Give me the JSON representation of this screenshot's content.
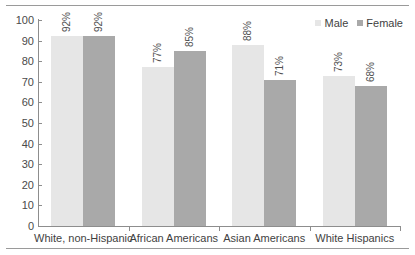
{
  "chart_data": {
    "type": "bar",
    "title": "",
    "subtitle": "",
    "xlabel": "",
    "ylabel": "",
    "ylim": [
      0,
      100
    ],
    "yticks": [
      0,
      10,
      20,
      30,
      40,
      50,
      60,
      70,
      80,
      90,
      100
    ],
    "ytick_labels": [
      "0",
      "10",
      "20",
      "30",
      "40",
      "50",
      "60",
      "70",
      "80",
      "90",
      "100"
    ],
    "grid": false,
    "legend_position": "top-right",
    "categories": [
      "White, non-Hispanic",
      "African Americans",
      "Asian Americans",
      "White Hispanics"
    ],
    "series": [
      {
        "name": "Male",
        "color": "#e6e6e6",
        "values": [
          92,
          77,
          88,
          73
        ],
        "labels": [
          "92%",
          "77%",
          "88%",
          "73%"
        ]
      },
      {
        "name": "Female",
        "color": "#a9a9a9",
        "values": [
          92,
          85,
          71,
          68
        ],
        "labels": [
          "92%",
          "85%",
          "71%",
          "68%"
        ]
      }
    ],
    "annotations": []
  },
  "legend": {
    "items": [
      {
        "label": "Male",
        "color": "#e6e6e6",
        "marker": "square-swatch-icon"
      },
      {
        "label": "Female",
        "color": "#a9a9a9",
        "marker": "square-swatch-icon"
      }
    ]
  }
}
